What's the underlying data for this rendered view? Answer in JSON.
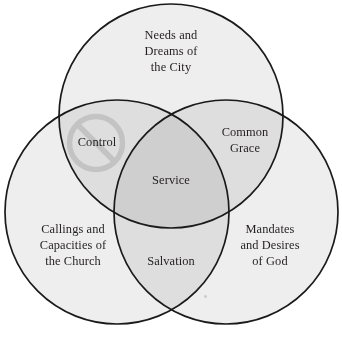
{
  "diagram": {
    "type": "venn-3-circle",
    "title": "",
    "background_color": "#ffffff",
    "stroke_color": "#1a1a1a",
    "text_color": "#231f20",
    "fill_single": "#eeeeee",
    "fill_double": "#e0e0e0",
    "fill_triple": "#d0d0d0",
    "prohibition_color": "#bdbdbd",
    "circles": [
      {
        "id": "top",
        "name": "needs-and-dreams-of-the-city",
        "cx": 171,
        "cy": 116,
        "r": 112,
        "label": "Needs and\nDreams of\nthe City"
      },
      {
        "id": "bottom-left",
        "name": "callings-and-capacities-of-the-church",
        "cx": 117,
        "cy": 212,
        "r": 112,
        "label": "Callings and\nCapacities of\nthe Church"
      },
      {
        "id": "bottom-right",
        "name": "mandates-and-desires-of-god",
        "cx": 226,
        "cy": 212,
        "r": 112,
        "label": "Mandates\nand Desires\nof God"
      }
    ],
    "intersections": [
      {
        "id": "top-left",
        "name": "control",
        "label": "Control",
        "circles": [
          "top",
          "bottom-left"
        ],
        "marked_prohibited": true,
        "icon": "prohibition-icon"
      },
      {
        "id": "top-right",
        "name": "common-grace",
        "label": "Common\nGrace",
        "circles": [
          "top",
          "bottom-right"
        ],
        "marked_prohibited": false
      },
      {
        "id": "bottom",
        "name": "salvation",
        "label": "Salvation",
        "circles": [
          "bottom-left",
          "bottom-right"
        ],
        "marked_prohibited": false
      },
      {
        "id": "center",
        "name": "service",
        "label": "Service",
        "circles": [
          "top",
          "bottom-left",
          "bottom-right"
        ],
        "marked_prohibited": false
      }
    ]
  }
}
